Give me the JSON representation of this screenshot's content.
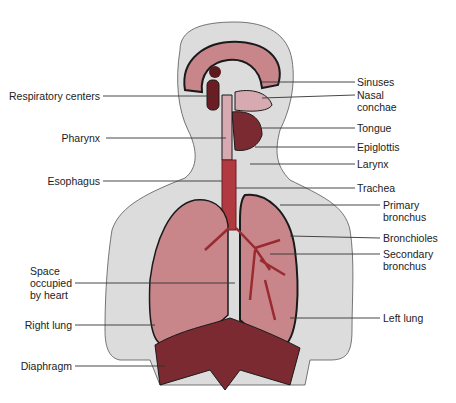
{
  "figure": {
    "colors": {
      "body_fill": "#dcdcdc",
      "lung_fill": "#c9868a",
      "tissue_dark": "#8a2a2f",
      "trachea": "#b03a3f",
      "outline": "#1a1a1a",
      "leader_line": "#333333"
    }
  },
  "labels_left": [
    {
      "text": "Respiratory centers"
    },
    {
      "text": "Pharynx"
    },
    {
      "text": "Esophagus"
    },
    {
      "text": "Space occupied by heart"
    },
    {
      "text": "Right lung"
    },
    {
      "text": "Diaphragm"
    }
  ],
  "labels_right": [
    {
      "text": "Sinuses"
    },
    {
      "text": "Nasal conchae"
    },
    {
      "text": "Tongue"
    },
    {
      "text": "Epiglottis"
    },
    {
      "text": "Larynx"
    },
    {
      "text": "Trachea"
    },
    {
      "text": "Primary bronchus"
    },
    {
      "text": "Bronchioles"
    },
    {
      "text": "Secondary bronchus"
    },
    {
      "text": "Left lung"
    }
  ]
}
